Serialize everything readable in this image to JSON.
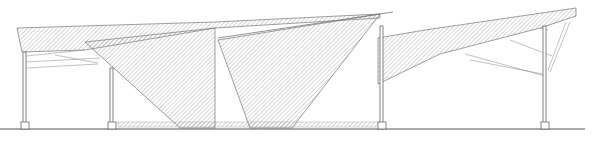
{
  "drawing": {
    "type": "architectural-elevation",
    "subject": "canopy structure with folded hatched roof planes",
    "colors": {
      "background": "#ffffff",
      "line": "#6e6e6e",
      "hatch": "#9a9a9a",
      "ground": "#555555"
    },
    "elements": {
      "roof_planes": 4,
      "columns": 4,
      "footings": 4
    }
  }
}
